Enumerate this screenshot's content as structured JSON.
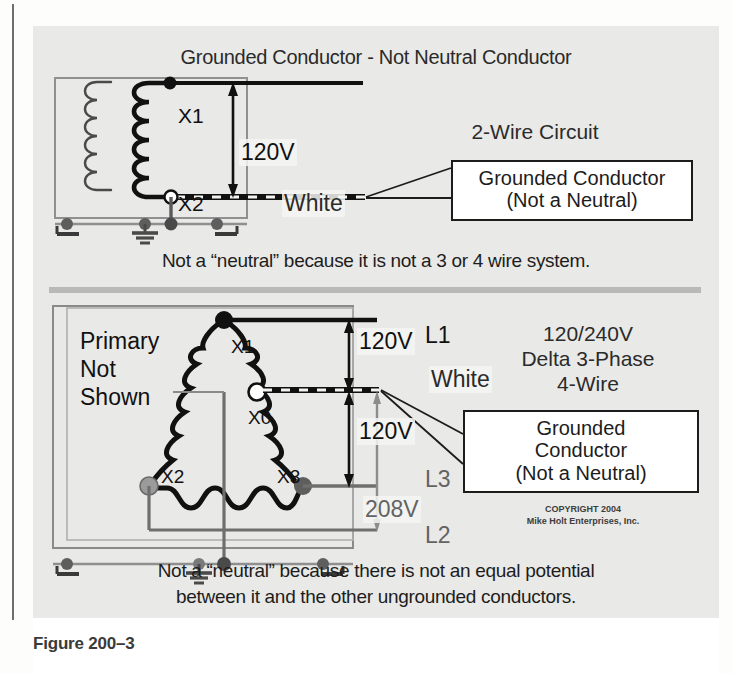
{
  "figure": {
    "caption": "Figure 200–3"
  },
  "top_diagram": {
    "title": "Grounded Conductor - Not Neutral Conductor",
    "system_label": "2-Wire Circuit",
    "voltage": "120V",
    "white_label": "White",
    "coil_x1": "X1",
    "coil_x2": "X2",
    "callout_line1": "Grounded Conductor",
    "callout_line2": "(Not a Neutral)",
    "footer": "Not a “neutral” because it is not a 3 or 4 wire system."
  },
  "bottom_diagram": {
    "primary_note_line1": "Primary",
    "primary_note_line2": "Not",
    "primary_note_line3": "Shown",
    "coil_x1": "X1",
    "coil_x0": "X0",
    "coil_x2": "X2",
    "coil_x3": "X3",
    "voltage_upper": "120V",
    "voltage_lower": "120V",
    "voltage_high_leg": "208V",
    "white_label": "White",
    "line_l1": "L1",
    "line_l2": "L2",
    "line_l3": "L3",
    "system_line1": "120/240V",
    "system_line2": "Delta 3-Phase",
    "system_line3": "4-Wire",
    "callout_line1": "Grounded",
    "callout_line2": "Conductor",
    "callout_line3": "(Not a Neutral)",
    "copyright_line1": "COPYRIGHT 2004",
    "copyright_line2": "Mike Holt Enterprises, Inc.",
    "footer_line1": "Not a “neutral” because there is not an equal potential",
    "footer_line2": "between it and the other ungrounded conductors."
  },
  "colors": {
    "panel_background": "#e9e9e7",
    "conductor_hot": "#111111",
    "conductor_grey": "#6f6f6f",
    "enclosure": "#8a8a8a",
    "node_x2": "#9b9b9b",
    "node_x3": "#5e5e5e"
  }
}
